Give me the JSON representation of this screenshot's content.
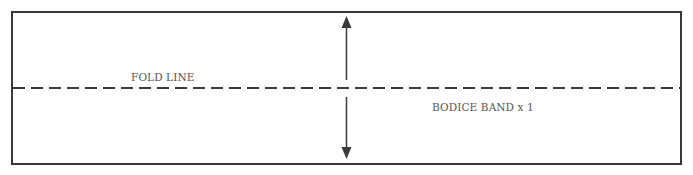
{
  "diagram": {
    "type": "sewing-pattern-piece",
    "fold_label": "FOLD LINE",
    "piece_label": "BODICE BAND x 1",
    "grainline": {
      "direction": "vertical",
      "arrowheads": "both-ends"
    },
    "colors": {
      "outline": "#3a3a3a",
      "text": "#555555",
      "background": "#ffffff"
    }
  }
}
